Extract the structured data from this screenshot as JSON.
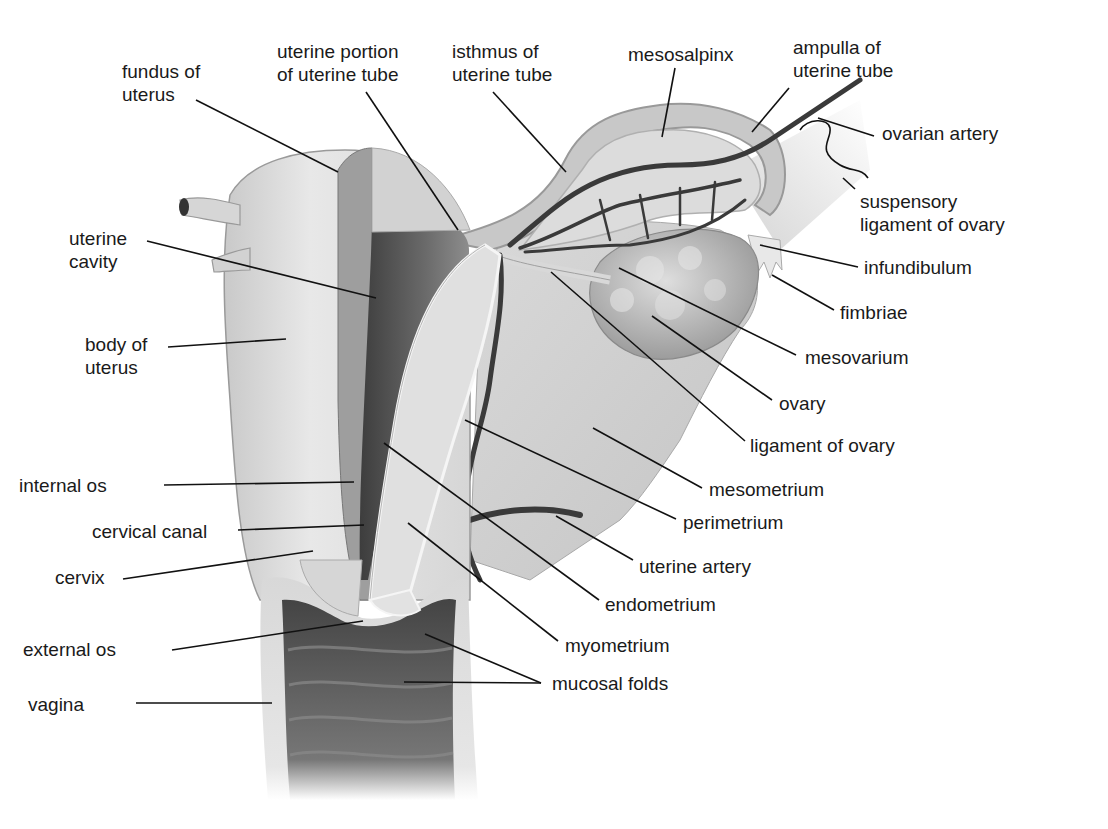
{
  "diagram": {
    "colors": {
      "background": "#ffffff",
      "label_text": "#1a1a1a",
      "leader_line": "#111111",
      "tissue_light": "#e4e4e4",
      "tissue_mid": "#cfcfcf",
      "tissue_dark": "#8a8a8a",
      "cavity": "#555555",
      "artery": "#3a3a3a"
    },
    "labels": [
      {
        "id": "fundus-of-uterus",
        "text": "fundus of\nuterus",
        "x": 122,
        "y": 60,
        "line": [
          [
            196,
            100
          ],
          [
            338,
            172
          ]
        ]
      },
      {
        "id": "uterine-portion-of-uterine-tube",
        "text": "uterine portion\nof uterine tube",
        "x": 277,
        "y": 40,
        "line": [
          [
            366,
            92
          ],
          [
            458,
            230
          ]
        ]
      },
      {
        "id": "isthmus-of-uterine-tube",
        "text": "isthmus of\nuterine tube",
        "x": 452,
        "y": 40,
        "line": [
          [
            493,
            92
          ],
          [
            566,
            172
          ]
        ]
      },
      {
        "id": "mesosalpinx",
        "text": "mesosalpinx",
        "x": 628,
        "y": 43,
        "line": [
          [
            675,
            68
          ],
          [
            662,
            137
          ]
        ]
      },
      {
        "id": "ampulla-of-uterine-tube",
        "text": "ampulla of\nuterine tube",
        "x": 793,
        "y": 36,
        "line": [
          [
            789,
            88
          ],
          [
            752,
            132
          ]
        ]
      },
      {
        "id": "ovarian-artery",
        "text": "ovarian artery",
        "x": 882,
        "y": 122,
        "line": [
          [
            874,
            136
          ],
          [
            818,
            118
          ]
        ]
      },
      {
        "id": "suspensory-ligament-of-ovary",
        "text": "suspensory\nligament of ovary",
        "x": 860,
        "y": 190,
        "line": [
          [
            855,
            189
          ],
          [
            843,
            178
          ]
        ]
      },
      {
        "id": "infundibulum",
        "text": "infundibulum",
        "x": 864,
        "y": 256,
        "line": [
          [
            858,
            267
          ],
          [
            760,
            245
          ]
        ]
      },
      {
        "id": "fimbriae",
        "text": "fimbriae",
        "x": 840,
        "y": 301,
        "line": [
          [
            834,
            310
          ],
          [
            772,
            275
          ]
        ]
      },
      {
        "id": "mesovarium",
        "text": "mesovarium",
        "x": 805,
        "y": 346,
        "line": [
          [
            796,
            355
          ],
          [
            619,
            268
          ]
        ]
      },
      {
        "id": "ovary",
        "text": "ovary",
        "x": 779,
        "y": 392,
        "line": [
          [
            772,
            400
          ],
          [
            652,
            316
          ]
        ]
      },
      {
        "id": "ligament-of-ovary",
        "text": "ligament of ovary",
        "x": 750,
        "y": 434,
        "line": [
          [
            745,
            441
          ],
          [
            551,
            272
          ]
        ]
      },
      {
        "id": "mesometrium",
        "text": "mesometrium",
        "x": 709,
        "y": 478,
        "line": [
          [
            702,
            488
          ],
          [
            593,
            428
          ]
        ]
      },
      {
        "id": "perimetrium",
        "text": "perimetrium",
        "x": 683,
        "y": 511,
        "line": [
          [
            676,
            519
          ],
          [
            465,
            420
          ]
        ]
      },
      {
        "id": "uterine-artery",
        "text": "uterine artery",
        "x": 639,
        "y": 555,
        "line": [
          [
            633,
            560
          ],
          [
            556,
            516
          ]
        ]
      },
      {
        "id": "endometrium",
        "text": "endometrium",
        "x": 605,
        "y": 593,
        "line": [
          [
            599,
            600
          ],
          [
            384,
            443
          ]
        ]
      },
      {
        "id": "myometrium",
        "text": "myometrium",
        "x": 565,
        "y": 634,
        "line": [
          [
            558,
            641
          ],
          [
            408,
            523
          ]
        ]
      },
      {
        "id": "mucosal-folds",
        "text": "mucosal folds",
        "x": 552,
        "y": 672,
        "line": [
          [
            541,
            683
          ],
          [
            425,
            634
          ]
        ],
        "line2": [
          [
            541,
            683
          ],
          [
            404,
            682
          ]
        ]
      },
      {
        "id": "uterine-cavity",
        "text": "uterine\ncavity",
        "x": 69,
        "y": 227,
        "line": [
          [
            147,
            241
          ],
          [
            376,
            298
          ]
        ]
      },
      {
        "id": "body-of-uterus",
        "text": "body of\nuterus",
        "x": 85,
        "y": 333,
        "line": [
          [
            168,
            347
          ],
          [
            286,
            339
          ]
        ]
      },
      {
        "id": "internal-os",
        "text": "internal os",
        "x": 19,
        "y": 474,
        "line": [
          [
            164,
            485
          ],
          [
            354,
            482
          ]
        ]
      },
      {
        "id": "cervical-canal",
        "text": "cervical canal",
        "x": 92,
        "y": 520,
        "line": [
          [
            238,
            530
          ],
          [
            364,
            525
          ]
        ]
      },
      {
        "id": "cervix",
        "text": "cervix",
        "x": 55,
        "y": 566,
        "line": [
          [
            123,
            579
          ],
          [
            313,
            551
          ]
        ]
      },
      {
        "id": "external-os",
        "text": "external os",
        "x": 23,
        "y": 638,
        "line": [
          [
            172,
            650
          ],
          [
            363,
            621
          ]
        ]
      },
      {
        "id": "vagina",
        "text": "vagina",
        "x": 28,
        "y": 693,
        "line": [
          [
            136,
            703
          ],
          [
            272,
            703
          ]
        ]
      }
    ]
  }
}
